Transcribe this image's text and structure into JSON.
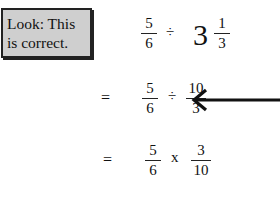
{
  "note": {
    "line1": "Look: This",
    "line2": "is correct."
  },
  "line1": {
    "frac1": {
      "num": "5",
      "den": "6"
    },
    "op": "÷",
    "whole": "3",
    "frac2": {
      "num": "1",
      "den": "3"
    }
  },
  "line2": {
    "eq": "=",
    "frac1": {
      "num": "5",
      "den": "6"
    },
    "op": "÷",
    "frac2": {
      "num": "10",
      "den": "3"
    },
    "arrow": "left-arrow-icon"
  },
  "line3": {
    "eq": "=",
    "frac1": {
      "num": "5",
      "den": "6"
    },
    "op": "x",
    "frac2": {
      "num": "3",
      "den": "10"
    }
  }
}
